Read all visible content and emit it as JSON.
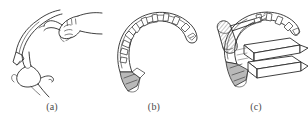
{
  "figure": {
    "background_color": "#ffffff",
    "ink_color": "#2b2b2b",
    "shade_color": "#b9b9b9",
    "panel_count": 3,
    "panels": [
      {
        "id": "a",
        "caption": "(a)",
        "subject": "two hands bending a curved toothed strip",
        "elements": [
          "upper-hand-gripping",
          "lower-hand-supporting",
          "curved-strip",
          "strip-tail-tab"
        ]
      },
      {
        "id": "b",
        "caption": "(b)",
        "subject": "curved toothed band shown alone in C shape",
        "elements": [
          "curved-band-outer-edge",
          "curved-band-inner-edge",
          "tooth-row",
          "shaded-tail-tab"
        ]
      },
      {
        "id": "c",
        "caption": "(c)",
        "subject": "curved toothed band with hatched handle tool and stacked blocks",
        "elements": [
          "hatched-handle",
          "shaft-with-tip",
          "curved-band",
          "stacked-blocks",
          "shaded-tail-tab"
        ]
      }
    ]
  }
}
